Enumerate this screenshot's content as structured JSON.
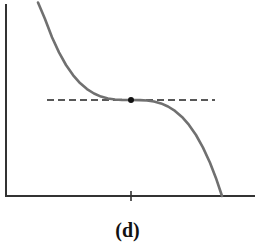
{
  "figure": {
    "caption": "(d)",
    "colors": {
      "axes": "#333333",
      "curve": "#707070",
      "tangent": "#222222",
      "point": "#111111"
    },
    "axes": {
      "y_axis": {
        "x": 6,
        "y_top": 4,
        "y_bottom": 196
      },
      "x_axis": {
        "y": 196,
        "x_left": 5,
        "x_right": 255
      },
      "x_tick": {
        "x": 131,
        "y1": 191,
        "y2": 201
      }
    },
    "curve": {
      "type": "cubic",
      "inflection_point": {
        "x": 131,
        "y": 100
      },
      "start": {
        "x": 38,
        "y": 2
      },
      "end": {
        "x": 222,
        "y": 196
      }
    },
    "tangent_line": {
      "style": "dashed",
      "x1": 47,
      "x2": 215,
      "y": 100
    },
    "point": {
      "x": 131,
      "y": 100,
      "r": 3
    }
  }
}
